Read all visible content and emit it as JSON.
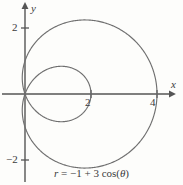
{
  "figure": {
    "caption_prefix": "r",
    "caption_equals": "=",
    "caption_body": "−1 + 3 cos(",
    "caption_theta": "θ",
    "caption_close": ")",
    "caption_full": "r = −1 + 3 cos(θ)",
    "background_color": "#fdfdfb",
    "curve_color": "#6f6f6f",
    "axis_color": "#555555",
    "text_color": "#3b3b3b"
  },
  "axes": {
    "x_label": "x",
    "y_label": "y",
    "x_ticks": [
      {
        "label": "2",
        "value": 2
      },
      {
        "label": "4",
        "value": 4
      }
    ],
    "y_ticks": [
      {
        "label": "2",
        "value": 2
      },
      {
        "label": "−2",
        "value": -2
      }
    ],
    "origin_px": {
      "x": 25,
      "y": 94
    },
    "px_per_unit": 33,
    "x_range": [
      -1.2,
      4.6
    ],
    "y_range": [
      -2.6,
      2.7
    ]
  },
  "chart_data": {
    "type": "line",
    "title": "",
    "subtitle": "",
    "xlabel": "x",
    "ylabel": "y",
    "xlim": [
      -1.2,
      4.6
    ],
    "ylim": [
      -2.6,
      2.7
    ],
    "grid": false,
    "legend": null,
    "coordinate_system": "polar",
    "equation": "r = -1 + 3 cos(theta)",
    "curve_name": "limacon-with-inner-loop",
    "parameters": {
      "a": -1,
      "b": 3,
      "trig": "cos"
    },
    "theta_range_deg": [
      0,
      360
    ],
    "annotations": [
      {
        "text": "2",
        "x": 2,
        "y": 0,
        "note": "inner loop crosses x-axis at x = 2"
      },
      {
        "text": "4",
        "x": 4,
        "y": 0,
        "note": "outer curve crosses x-axis at x = 4"
      }
    ],
    "series": [
      {
        "name": "r = -1 + 3 cos(theta)",
        "color": "#6f6f6f",
        "polar_points": [
          {
            "theta_deg": 0,
            "r": 2.0
          },
          {
            "theta_deg": 10,
            "r": 1.954
          },
          {
            "theta_deg": 20,
            "r": 1.819
          },
          {
            "theta_deg": 30,
            "r": 1.598
          },
          {
            "theta_deg": 40,
            "r": 1.298
          },
          {
            "theta_deg": 50,
            "r": 0.928
          },
          {
            "theta_deg": 60,
            "r": 0.5
          },
          {
            "theta_deg": 70,
            "r": 0.026
          },
          {
            "theta_deg": 70.53,
            "r": 0.0
          },
          {
            "theta_deg": 80,
            "r": -0.479
          },
          {
            "theta_deg": 90,
            "r": -1.0
          },
          {
            "theta_deg": 100,
            "r": -1.521
          },
          {
            "theta_deg": 110,
            "r": -2.026
          },
          {
            "theta_deg": 120,
            "r": -2.5
          },
          {
            "theta_deg": 130,
            "r": -2.928
          },
          {
            "theta_deg": 140,
            "r": -3.298
          },
          {
            "theta_deg": 150,
            "r": -3.598
          },
          {
            "theta_deg": 160,
            "r": -3.819
          },
          {
            "theta_deg": 170,
            "r": -3.954
          },
          {
            "theta_deg": 180,
            "r": -4.0
          },
          {
            "theta_deg": 190,
            "r": -3.954
          },
          {
            "theta_deg": 200,
            "r": -3.819
          },
          {
            "theta_deg": 210,
            "r": -3.598
          },
          {
            "theta_deg": 220,
            "r": -3.298
          },
          {
            "theta_deg": 230,
            "r": -2.928
          },
          {
            "theta_deg": 240,
            "r": -2.5
          },
          {
            "theta_deg": 250,
            "r": -2.026
          },
          {
            "theta_deg": 260,
            "r": -1.521
          },
          {
            "theta_deg": 270,
            "r": -1.0
          },
          {
            "theta_deg": 280,
            "r": -0.479
          },
          {
            "theta_deg": 289.47,
            "r": 0.0
          },
          {
            "theta_deg": 290,
            "r": 0.026
          },
          {
            "theta_deg": 300,
            "r": 0.5
          },
          {
            "theta_deg": 310,
            "r": 0.928
          },
          {
            "theta_deg": 320,
            "r": 1.298
          },
          {
            "theta_deg": 330,
            "r": 1.598
          },
          {
            "theta_deg": 340,
            "r": 1.819
          },
          {
            "theta_deg": 350,
            "r": 1.954
          },
          {
            "theta_deg": 360,
            "r": 2.0
          }
        ],
        "extrema": {
          "max_x": 4.0,
          "min_x": -0.125,
          "max_y": 2.191,
          "min_y": -2.191,
          "inner_loop_max_x": 2.0
        }
      }
    ]
  }
}
